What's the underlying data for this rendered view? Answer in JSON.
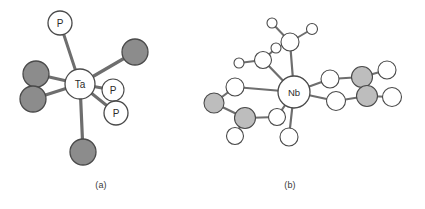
{
  "figure": {
    "background_color": "#ffffff",
    "captions": [
      {
        "id": "a",
        "text": "(a)"
      },
      {
        "id": "b",
        "text": "(b)"
      }
    ]
  },
  "style": {
    "bond_color": "#6e6e6e",
    "bond_color_dark": "#5a5a5a",
    "atom_outline": "#4a4a4a",
    "atom_fill_open": "#ffffff",
    "atom_fill_shaded_dark": "#8c8c8c",
    "atom_fill_shaded_light": "#bdbdbd",
    "label_color": "#2b2b2b"
  },
  "panels": [
    {
      "id": "a",
      "caption": "(a)",
      "center_label": "Ta",
      "description": "seven-coordinate tantalum complex with three phosphine ligands and four halide ligands",
      "atoms": [
        {
          "name": "Ta-center",
          "label": "Ta",
          "cx": 80,
          "cy": 84,
          "r": 15,
          "fill": "open",
          "label_size": "normal"
        },
        {
          "name": "P-top",
          "label": "P",
          "cx": 60,
          "cy": 23,
          "r": 12,
          "fill": "open",
          "label_size": "normal"
        },
        {
          "name": "P-right-upper",
          "label": "P",
          "cx": 113,
          "cy": 90,
          "r": 11,
          "fill": "open",
          "label_size": "normal"
        },
        {
          "name": "P-right-lower",
          "label": "P",
          "cx": 116,
          "cy": 113,
          "r": 12,
          "fill": "open",
          "label_size": "normal"
        },
        {
          "name": "X-upper-right",
          "label": "",
          "cx": 135,
          "cy": 52,
          "r": 13,
          "fill": "shaded-dark",
          "label_size": "normal"
        },
        {
          "name": "X-left-upper",
          "label": "",
          "cx": 36,
          "cy": 74,
          "r": 13,
          "fill": "shaded-dark",
          "label_size": "normal"
        },
        {
          "name": "X-left-lower",
          "label": "",
          "cx": 33,
          "cy": 99,
          "r": 13,
          "fill": "shaded-dark",
          "label_size": "normal"
        },
        {
          "name": "X-bottom",
          "label": "",
          "cx": 83,
          "cy": 152,
          "r": 13,
          "fill": "shaded-dark",
          "label_size": "normal"
        }
      ],
      "bonds": [
        {
          "from": "Ta-center",
          "to": "P-top",
          "width": 3
        },
        {
          "from": "Ta-center",
          "to": "P-right-upper",
          "width": 3
        },
        {
          "from": "Ta-center",
          "to": "P-right-lower",
          "width": 3
        },
        {
          "from": "Ta-center",
          "to": "X-upper-right",
          "width": 3.2
        },
        {
          "from": "Ta-center",
          "to": "X-left-upper",
          "width": 3.2
        },
        {
          "from": "Ta-center",
          "to": "X-left-lower",
          "width": 3.2
        },
        {
          "from": "Ta-center",
          "to": "X-bottom",
          "width": 3.2
        }
      ]
    },
    {
      "id": "b",
      "caption": "(b)",
      "center_label": "Nb",
      "description": "eight-coordinate niobium complex with open-circle and shaded-circle ligand atoms forming chelate rings",
      "atoms": [
        {
          "name": "Nb-center",
          "label": "Nb",
          "cx": 294,
          "cy": 92,
          "r": 16,
          "fill": "open",
          "label_size": "small"
        },
        {
          "name": "O-top-branch",
          "label": "",
          "cx": 290,
          "cy": 42,
          "r": 9,
          "fill": "open",
          "label_size": "normal"
        },
        {
          "name": "O-top-left-tip",
          "label": "",
          "cx": 272,
          "cy": 23,
          "r": 5,
          "fill": "open",
          "label_size": "normal"
        },
        {
          "name": "O-top-right-tip",
          "label": "",
          "cx": 312,
          "cy": 29,
          "r": 5.5,
          "fill": "open",
          "label_size": "normal"
        },
        {
          "name": "O-upperleft-branch",
          "label": "",
          "cx": 263,
          "cy": 60,
          "r": 8.5,
          "fill": "open",
          "label_size": "normal"
        },
        {
          "name": "O-upperleft-tip-up",
          "label": "",
          "cx": 276,
          "cy": 48,
          "r": 5,
          "fill": "open",
          "label_size": "normal"
        },
        {
          "name": "O-upperleft-tip-left",
          "label": "",
          "cx": 239,
          "cy": 63,
          "r": 5,
          "fill": "open",
          "label_size": "normal"
        },
        {
          "name": "O-left-upper",
          "label": "",
          "cx": 235,
          "cy": 87,
          "r": 9,
          "fill": "open",
          "label_size": "normal"
        },
        {
          "name": "X-left-far",
          "label": "",
          "cx": 214,
          "cy": 103,
          "r": 10,
          "fill": "shaded-light",
          "label_size": "normal"
        },
        {
          "name": "X-left-lower",
          "label": "",
          "cx": 245,
          "cy": 118,
          "r": 10.5,
          "fill": "shaded-light",
          "label_size": "normal"
        },
        {
          "name": "O-left-bottom-tip",
          "label": "",
          "cx": 235,
          "cy": 136,
          "r": 8.5,
          "fill": "open",
          "label_size": "normal"
        },
        {
          "name": "O-lower-inner",
          "label": "",
          "cx": 277,
          "cy": 117,
          "r": 8.5,
          "fill": "open",
          "label_size": "normal"
        },
        {
          "name": "O-bottom",
          "label": "",
          "cx": 289,
          "cy": 137,
          "r": 9,
          "fill": "open",
          "label_size": "normal"
        },
        {
          "name": "O-right-upper",
          "label": "",
          "cx": 330,
          "cy": 79,
          "r": 9,
          "fill": "open",
          "label_size": "normal"
        },
        {
          "name": "X-right-upper",
          "label": "",
          "cx": 362,
          "cy": 77,
          "r": 10.5,
          "fill": "shaded-light",
          "label_size": "normal"
        },
        {
          "name": "O-right-upper-tip",
          "label": "",
          "cx": 387,
          "cy": 70,
          "r": 9,
          "fill": "open",
          "label_size": "normal"
        },
        {
          "name": "O-right-lower",
          "label": "",
          "cx": 336,
          "cy": 101,
          "r": 9.5,
          "fill": "open",
          "label_size": "normal"
        },
        {
          "name": "X-right-lower",
          "label": "",
          "cx": 367,
          "cy": 96,
          "r": 10.5,
          "fill": "shaded-light",
          "label_size": "normal"
        },
        {
          "name": "O-right-lower-tip",
          "label": "",
          "cx": 392,
          "cy": 97,
          "r": 9.5,
          "fill": "open",
          "label_size": "normal"
        }
      ],
      "bonds": [
        {
          "from": "Nb-center",
          "to": "O-top-branch",
          "width": 2.2
        },
        {
          "from": "O-top-branch",
          "to": "O-top-left-tip",
          "width": 2.0
        },
        {
          "from": "O-top-branch",
          "to": "O-top-right-tip",
          "width": 2.0
        },
        {
          "from": "Nb-center",
          "to": "O-upperleft-branch",
          "width": 2.2
        },
        {
          "from": "O-upperleft-branch",
          "to": "O-upperleft-tip-up",
          "width": 2.0
        },
        {
          "from": "O-upperleft-branch",
          "to": "O-upperleft-tip-left",
          "width": 2.0
        },
        {
          "from": "Nb-center",
          "to": "O-left-upper",
          "width": 2.2
        },
        {
          "from": "O-left-upper",
          "to": "X-left-far",
          "width": 2.2
        },
        {
          "from": "X-left-far",
          "to": "X-left-lower",
          "width": 2.2
        },
        {
          "from": "X-left-lower",
          "to": "O-left-bottom-tip",
          "width": 2.2
        },
        {
          "from": "X-left-lower",
          "to": "O-lower-inner",
          "width": 2.2
        },
        {
          "from": "Nb-center",
          "to": "O-lower-inner",
          "width": 2.2
        },
        {
          "from": "Nb-center",
          "to": "O-bottom",
          "width": 2.2
        },
        {
          "from": "Nb-center",
          "to": "O-right-upper",
          "width": 2.2
        },
        {
          "from": "O-right-upper",
          "to": "X-right-upper",
          "width": 2.2
        },
        {
          "from": "X-right-upper",
          "to": "O-right-upper-tip",
          "width": 2.2
        },
        {
          "from": "X-right-upper",
          "to": "X-right-lower",
          "width": 2.2
        },
        {
          "from": "Nb-center",
          "to": "O-right-lower",
          "width": 2.2
        },
        {
          "from": "O-right-lower",
          "to": "X-right-lower",
          "width": 2.2
        },
        {
          "from": "X-right-lower",
          "to": "O-right-lower-tip",
          "width": 2.2
        }
      ]
    }
  ]
}
